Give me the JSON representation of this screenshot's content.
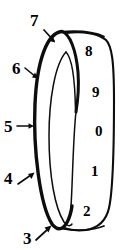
{
  "figure": {
    "kind": "patent-line-drawing",
    "colors": {
      "ink": "#0d0d0d",
      "background": "#ffffff"
    },
    "callouts": [
      {
        "id": "callout-7",
        "label": "7",
        "x": 30,
        "y": 12,
        "arrow": {
          "x1": 44,
          "y1": 30,
          "x2": 55,
          "y2": 42
        }
      },
      {
        "id": "callout-6",
        "label": "6",
        "x": 12,
        "y": 60,
        "arrow": {
          "x1": 25,
          "y1": 68,
          "x2": 38,
          "y2": 78
        }
      },
      {
        "id": "callout-5",
        "label": "5",
        "x": 4,
        "y": 118,
        "arrow": {
          "x1": 17,
          "y1": 126,
          "x2": 34,
          "y2": 126
        }
      },
      {
        "id": "callout-4",
        "label": "4",
        "x": 4,
        "y": 170,
        "arrow": {
          "x1": 18,
          "y1": 184,
          "x2": 35,
          "y2": 172
        }
      },
      {
        "id": "callout-3",
        "label": "3",
        "x": 23,
        "y": 230,
        "arrow": {
          "x1": 36,
          "y1": 240,
          "x2": 51,
          "y2": 226
        }
      }
    ],
    "digits": [
      {
        "id": "digit-8",
        "label": "8",
        "x": 85,
        "y": 44
      },
      {
        "id": "digit-9",
        "label": "9",
        "x": 92,
        "y": 85
      },
      {
        "id": "digit-0",
        "label": "0",
        "x": 95,
        "y": 124
      },
      {
        "id": "digit-1",
        "label": "1",
        "x": 91,
        "y": 164
      },
      {
        "id": "digit-2",
        "label": "2",
        "x": 83,
        "y": 204
      }
    ]
  }
}
